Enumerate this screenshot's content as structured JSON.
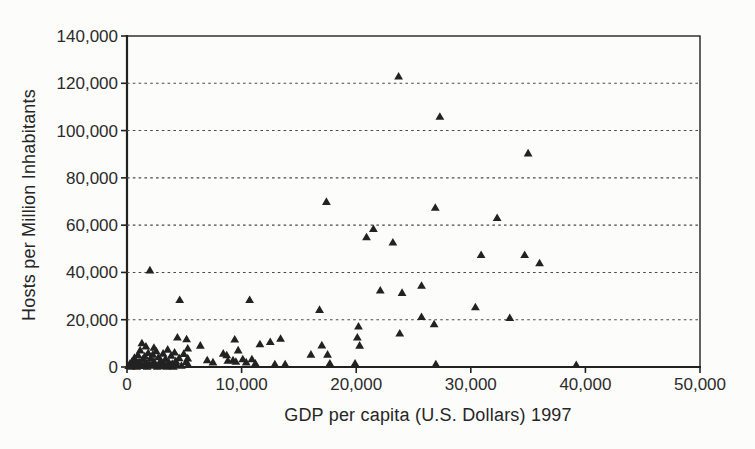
{
  "figure": {
    "background": "#fcfcfa",
    "ink": "#222222",
    "gridline_color": "#4a4a4a",
    "marker_color": "#222222"
  },
  "chart_data": {
    "type": "scatter",
    "title": "",
    "xlabel": "GDP per capita (U.S. Dollars) 1997",
    "ylabel": "Hosts per Million Inhabitants",
    "xlim": [
      0,
      50000
    ],
    "ylim": [
      0,
      140000
    ],
    "x_ticks": [
      0,
      10000,
      20000,
      30000,
      40000,
      50000
    ],
    "y_ticks": [
      0,
      20000,
      40000,
      60000,
      80000,
      100000,
      120000,
      140000
    ],
    "x_tick_labels": [
      "0",
      "10,000",
      "20,000",
      "30,000",
      "40,000",
      "50,000"
    ],
    "y_tick_labels": [
      "0",
      "20,000",
      "40,000",
      "60,000",
      "80,000",
      "100,000",
      "120,000",
      "140,000"
    ],
    "grid": "horizontal-dashed",
    "legend": "none",
    "marker": "filled-triangle-up",
    "points": [
      [
        23700,
        123000
      ],
      [
        27300,
        106000
      ],
      [
        35000,
        90500
      ],
      [
        17400,
        70000
      ],
      [
        26900,
        67500
      ],
      [
        32300,
        63200
      ],
      [
        21500,
        58500
      ],
      [
        20900,
        55000
      ],
      [
        23200,
        52800
      ],
      [
        30900,
        47500
      ],
      [
        34700,
        47500
      ],
      [
        36000,
        44000
      ],
      [
        2000,
        41000
      ],
      [
        25700,
        34500
      ],
      [
        22100,
        32500
      ],
      [
        24000,
        31500
      ],
      [
        4600,
        28500
      ],
      [
        10700,
        28500
      ],
      [
        30400,
        25400
      ],
      [
        16800,
        24300
      ],
      [
        25700,
        21300
      ],
      [
        33400,
        20900
      ],
      [
        26800,
        18200
      ],
      [
        20200,
        17300
      ],
      [
        23800,
        14300
      ],
      [
        20100,
        12600
      ],
      [
        13400,
        12100
      ],
      [
        4400,
        12600
      ],
      [
        5200,
        11900
      ],
      [
        9400,
        11800
      ],
      [
        12500,
        10700
      ],
      [
        11600,
        9800
      ],
      [
        1300,
        10200
      ],
      [
        6400,
        9200
      ],
      [
        17000,
        9300
      ],
      [
        20300,
        9200
      ],
      [
        9700,
        7200
      ],
      [
        8400,
        5800
      ],
      [
        16050,
        5400
      ],
      [
        17500,
        5400
      ],
      [
        8700,
        5100
      ],
      [
        5300,
        8000
      ],
      [
        5300,
        3800
      ],
      [
        7000,
        3000
      ],
      [
        7500,
        2100
      ],
      [
        9250,
        3000
      ],
      [
        10100,
        3400
      ],
      [
        10400,
        2100
      ],
      [
        10900,
        3400
      ],
      [
        11200,
        1600
      ],
      [
        12900,
        1300
      ],
      [
        13800,
        1300
      ],
      [
        9500,
        2400
      ],
      [
        8800,
        2800
      ],
      [
        17700,
        1600
      ],
      [
        19900,
        1600
      ],
      [
        26950,
        1300
      ],
      [
        39200,
        1000
      ],
      [
        150,
        600
      ],
      [
        250,
        1500
      ],
      [
        350,
        300
      ],
      [
        450,
        2600
      ],
      [
        550,
        900
      ],
      [
        650,
        4000
      ],
      [
        750,
        1800
      ],
      [
        850,
        300
      ],
      [
        950,
        5200
      ],
      [
        1050,
        2300
      ],
      [
        1150,
        7200
      ],
      [
        1250,
        1100
      ],
      [
        1350,
        3300
      ],
      [
        1450,
        600
      ],
      [
        1550,
        4700
      ],
      [
        1650,
        2000
      ],
      [
        1750,
        300
      ],
      [
        1850,
        6100
      ],
      [
        1950,
        1400
      ],
      [
        2050,
        3800
      ],
      [
        2150,
        700
      ],
      [
        2250,
        5400
      ],
      [
        2350,
        2500
      ],
      [
        2450,
        1000
      ],
      [
        2550,
        6800
      ],
      [
        2650,
        300
      ],
      [
        2750,
        4300
      ],
      [
        2850,
        1700
      ],
      [
        2950,
        2900
      ],
      [
        3050,
        600
      ],
      [
        3150,
        5800
      ],
      [
        3250,
        1300
      ],
      [
        3350,
        3500
      ],
      [
        3450,
        300
      ],
      [
        3550,
        7500
      ],
      [
        3650,
        2100
      ],
      [
        3750,
        900
      ],
      [
        3850,
        4900
      ],
      [
        3950,
        1500
      ],
      [
        4050,
        300
      ],
      [
        4150,
        6300
      ],
      [
        4250,
        2700
      ],
      [
        4350,
        1100
      ],
      [
        4550,
        3900
      ],
      [
        4750,
        700
      ],
      [
        4950,
        5700
      ],
      [
        5150,
        2200
      ],
      [
        5350,
        1000
      ],
      [
        2350,
        8300
      ],
      [
        1650,
        8800
      ]
    ]
  }
}
